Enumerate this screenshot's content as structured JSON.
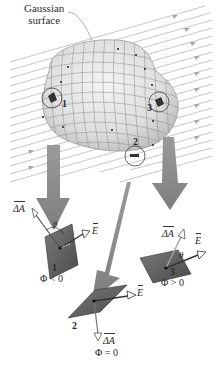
{
  "figure": {
    "surface_label_line1": "Gaussian",
    "surface_label_line2": "surface",
    "colors": {
      "field_lines": "#b5b5b5",
      "surface_fill": "#e6e6e6",
      "surface_grid": "#8a8a8a",
      "big_arrow": "#8c8c8c",
      "patch": "#5e5e5e",
      "vector_outline": "#555555"
    },
    "patches": [
      {
        "id": 1,
        "label": "1",
        "theta": "θ",
        "area_vector": "ΔA",
        "field_vector": "E",
        "flux_relation": "Φ < 0"
      },
      {
        "id": 2,
        "label": "2",
        "area_vector": "ΔA",
        "field_vector": "E",
        "flux_relation": "Φ = 0"
      },
      {
        "id": 3,
        "label": "3",
        "theta": "θ",
        "area_vector": "ΔA",
        "field_vector": "E",
        "flux_relation": "Φ > 0"
      }
    ],
    "surface_markers": [
      "1",
      "2",
      "3"
    ]
  }
}
